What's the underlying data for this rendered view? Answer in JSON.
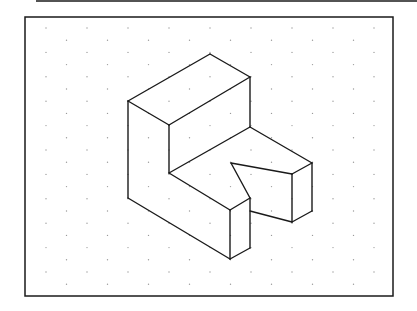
{
  "diagram": {
    "type": "isometric-drawing",
    "colors": {
      "background": "#ffffff",
      "line": "#1a1a1a",
      "grid_dot": "#9a9a9a"
    },
    "frame": {
      "x": 25,
      "y": 17,
      "width": 368,
      "height": 279
    },
    "top_rule": {
      "x1": 36,
      "y1": 1,
      "x2": 417,
      "y2": 1
    },
    "grid": {
      "origin_x": 46,
      "origin_y": 28,
      "dx": 41,
      "dy": 12.2,
      "rows": 22,
      "cols": 9
    },
    "edges": [
      [
        210,
        54,
        128,
        101
      ],
      [
        210,
        54,
        250,
        77
      ],
      [
        128,
        101,
        169,
        125
      ],
      [
        169,
        125,
        250,
        77
      ],
      [
        128,
        101,
        128,
        198
      ],
      [
        169,
        125,
        169,
        173
      ],
      [
        250,
        77,
        250,
        127
      ],
      [
        169,
        173,
        250,
        127
      ],
      [
        250,
        127,
        312,
        163
      ],
      [
        128,
        198,
        230,
        259
      ],
      [
        169,
        173,
        230,
        210
      ],
      [
        230,
        210,
        230,
        259
      ],
      [
        230,
        210,
        250,
        198
      ],
      [
        250,
        198,
        250,
        248
      ],
      [
        230,
        259,
        250,
        248
      ],
      [
        250,
        198,
        231,
        163
      ],
      [
        231,
        163,
        292,
        174
      ],
      [
        292,
        174,
        312,
        163
      ],
      [
        292,
        174,
        292,
        222
      ],
      [
        312,
        163,
        312,
        211
      ],
      [
        250,
        211,
        292,
        222
      ],
      [
        292,
        222,
        312,
        211
      ]
    ]
  }
}
